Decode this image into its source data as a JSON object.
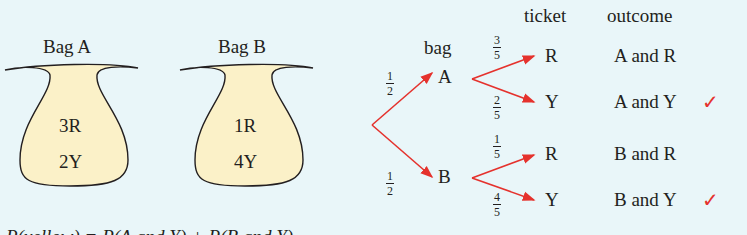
{
  "bags": [
    {
      "label": "Bag A",
      "line1": "3R",
      "line2": "2Y"
    },
    {
      "label": "Bag B",
      "line1": "1R",
      "line2": "4Y"
    }
  ],
  "tree": {
    "headers": {
      "bag": "bag",
      "ticket": "ticket",
      "outcome": "outcome"
    },
    "first_level": [
      {
        "node": "A",
        "prob_num": "1",
        "prob_den": "2"
      },
      {
        "node": "B",
        "prob_num": "1",
        "prob_den": "2"
      }
    ],
    "second_level": [
      {
        "node": "R",
        "prob_num": "3",
        "prob_den": "5",
        "outcome": "A and R",
        "checked": false
      },
      {
        "node": "Y",
        "prob_num": "2",
        "prob_den": "5",
        "outcome": "A and Y",
        "checked": true
      },
      {
        "node": "R",
        "prob_num": "1",
        "prob_den": "5",
        "outcome": "B and R",
        "checked": false
      },
      {
        "node": "Y",
        "prob_num": "4",
        "prob_den": "5",
        "outcome": "B and Y",
        "checked": true
      }
    ],
    "check_mark": "✓",
    "arrow_color": "#e5322d",
    "bag_fill": "#fbf1c8"
  },
  "equation_cut": "P(yellow) = P(A and Y) + P(B and Y)"
}
